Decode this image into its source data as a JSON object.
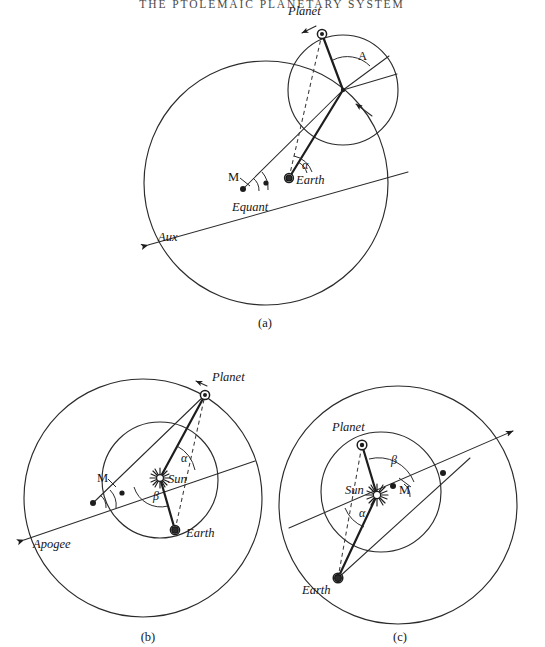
{
  "page": {
    "title": "THE PTOLEMAIC PLANETARY SYSTEM",
    "background_color": "#ffffff",
    "ink_color": "#1d1d1d",
    "width": 545,
    "height": 647
  },
  "figure": {
    "kind": "line-diagram",
    "panels": [
      {
        "id": "a",
        "caption": "(a)",
        "caption_pos": [
          265,
          327
        ],
        "labels": [
          {
            "name": "planet",
            "text": "Planet",
            "x": 288,
            "y": 15,
            "style": "italic"
          },
          {
            "name": "apex-angle",
            "text": "A",
            "x": 358,
            "y": 60,
            "style": "roman"
          },
          {
            "name": "mean-motion",
            "text": "M",
            "x": 228,
            "y": 181,
            "style": "roman"
          },
          {
            "name": "earth",
            "text": "Earth",
            "x": 296,
            "y": 184,
            "style": "italic"
          },
          {
            "name": "equant",
            "text": "Equant",
            "x": 232,
            "y": 211,
            "style": "italic"
          },
          {
            "name": "aux",
            "text": "Aux",
            "x": 158,
            "y": 241,
            "style": "italic"
          },
          {
            "name": "alpha",
            "text": "α",
            "x": 302,
            "y": 169,
            "style": "greek"
          }
        ]
      },
      {
        "id": "b",
        "caption": "(b)",
        "caption_pos": [
          148,
          641
        ],
        "labels": [
          {
            "name": "planet",
            "text": "Planet",
            "x": 212,
            "y": 381,
            "style": "italic"
          },
          {
            "name": "alpha",
            "text": "α",
            "x": 181,
            "y": 462,
            "style": "greek"
          },
          {
            "name": "sun",
            "text": "Sun",
            "x": 168,
            "y": 483,
            "style": "italic"
          },
          {
            "name": "mean-motion",
            "text": "M",
            "x": 97,
            "y": 482,
            "style": "roman"
          },
          {
            "name": "beta",
            "text": "β",
            "x": 153,
            "y": 500,
            "style": "greek"
          },
          {
            "name": "earth",
            "text": "Earth",
            "x": 186,
            "y": 537,
            "style": "italic"
          },
          {
            "name": "apogee",
            "text": "Apogee",
            "x": 33,
            "y": 548,
            "style": "italic"
          }
        ]
      },
      {
        "id": "c",
        "caption": "(c)",
        "caption_pos": [
          400,
          641
        ],
        "labels": [
          {
            "name": "planet",
            "text": "Planet",
            "x": 332,
            "y": 431,
            "style": "italic"
          },
          {
            "name": "beta",
            "text": "β",
            "x": 391,
            "y": 464,
            "style": "greek"
          },
          {
            "name": "sun",
            "text": "Sun",
            "x": 345,
            "y": 494,
            "style": "italic"
          },
          {
            "name": "mean-motion",
            "text": "M",
            "x": 399,
            "y": 494,
            "style": "roman"
          },
          {
            "name": "alpha",
            "text": "α",
            "x": 359,
            "y": 517,
            "style": "greek"
          },
          {
            "name": "earth",
            "text": "Earth",
            "x": 302,
            "y": 594,
            "style": "italic"
          }
        ]
      }
    ],
    "icon_names": [
      "planet-icon",
      "earth-icon",
      "sun-icon",
      "arrowhead-icon",
      "angle-arc-icon",
      "center-dot-icon"
    ]
  }
}
